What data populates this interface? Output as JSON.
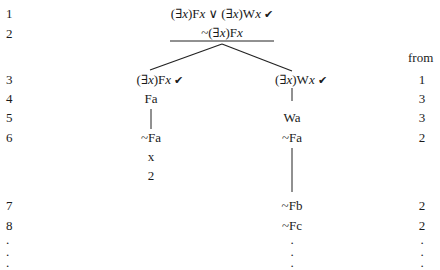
{
  "tree": {
    "from_header": "from",
    "check_mark": "✔",
    "line_numbers": [
      "1",
      "2",
      "3",
      "4",
      "5",
      "6",
      "7",
      "8",
      ".",
      ".",
      "."
    ],
    "trunk": {
      "line1_a": "(∃",
      "line1_var1": "x",
      "line1_b": ")F",
      "line1_var2": "x",
      "line1_or": " ∨ (∃",
      "line1_var3": "x",
      "line1_c": ")W",
      "line1_var4": "x",
      "line2_a": "~(∃",
      "line2_var1": "x",
      "line2_b": ")F",
      "line2_var2": "x"
    },
    "left_branch": {
      "head_a": "(∃",
      "head_var1": "x",
      "head_b": ")F",
      "head_var2": "x",
      "row4": "Fa",
      "row6": "~Fa",
      "closed_mark": "x",
      "closed_ref": "2"
    },
    "right_branch": {
      "head_a": "(∃",
      "head_var1": "x",
      "head_b": ")W",
      "head_var2": "x",
      "row5": "Wa",
      "row6": "~Fa",
      "row7": "~Fb",
      "row8": "~Fc",
      "dots": [
        ".",
        ".",
        "."
      ]
    },
    "from_column": [
      "1",
      "3",
      "3",
      "2",
      "2",
      "2",
      ".",
      ".",
      "."
    ]
  }
}
